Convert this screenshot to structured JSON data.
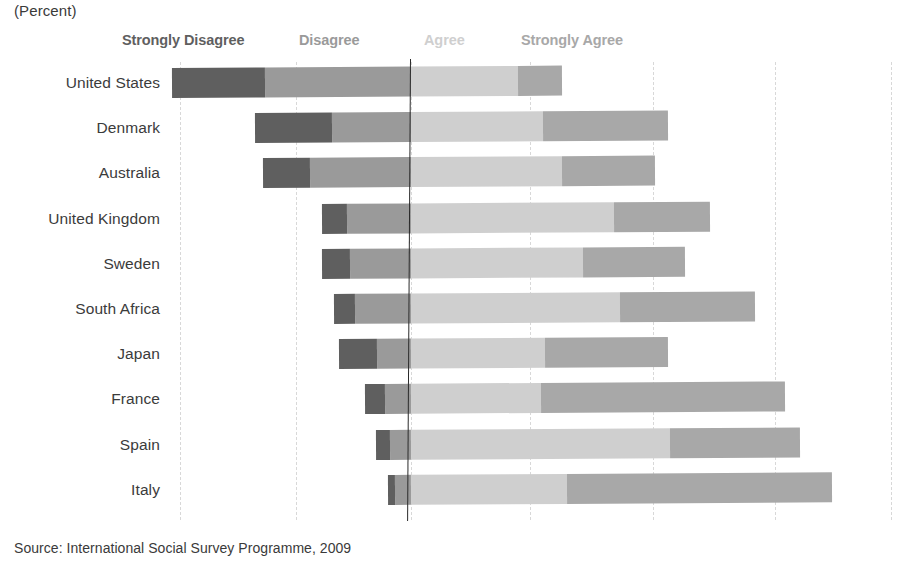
{
  "unit_label": "(Percent)",
  "source": "Source: International Social Survey Programme, 2009",
  "legend": {
    "strongly_disagree": "Strongly Disagree",
    "disagree": "Disagree",
    "agree": "Agree",
    "strongly_agree": "Strongly Agree"
  },
  "colors": {
    "strongly_disagree": "#5f5f5f",
    "disagree": "#9a9a9a",
    "agree": "#cfcfcf",
    "strongly_agree": "#a8a8a8",
    "zero_line": "#2b2b2b",
    "gridline": "#d8d8d8",
    "text": "#3b3b3b",
    "background": "#ffffff"
  },
  "chart_data": {
    "type": "bar",
    "subtype": "diverging-stacked-horizontal",
    "title": "",
    "subtitle": "(Percent)",
    "xlabel": "",
    "ylabel": "",
    "grid": true,
    "legend_position": "top",
    "axis": {
      "zero_at": "boundary between Disagree and Agree",
      "gridline_spacing_points": 25,
      "gridline_positions_px": [
        180,
        296,
        411,
        530,
        653,
        775,
        891
      ],
      "zero_line_px": 411,
      "px_per_point": 4.72
    },
    "legend_entries": [
      "Strongly Disagree",
      "Disagree",
      "Agree",
      "Strongly Agree"
    ],
    "categories": [
      "United States",
      "Denmark",
      "Australia",
      "United Kingdom",
      "Sweden",
      "South Africa",
      "Japan",
      "France",
      "Spain",
      "Italy"
    ],
    "series": [
      {
        "name": "Strongly Disagree",
        "color": "#5f5f5f",
        "values": [
          19.7,
          16.3,
          10.0,
          5.3,
          5.9,
          4.4,
          8.1,
          4.2,
          3.0,
          1.5
        ]
      },
      {
        "name": "Disagree",
        "color": "#9a9a9a",
        "values": [
          30.9,
          16.7,
          21.4,
          13.6,
          12.9,
          11.9,
          7.2,
          5.5,
          4.4,
          3.4
        ]
      },
      {
        "name": "Agree",
        "color": "#cfcfcf",
        "values": [
          22.7,
          28.0,
          32.0,
          43.0,
          36.4,
          44.3,
          28.4,
          27.5,
          54.9,
          33.1
        ]
      },
      {
        "name": "Strongly Agree",
        "color": "#a8a8a8",
        "values": [
          9.3,
          26.5,
          19.7,
          20.3,
          21.6,
          28.6,
          26.1,
          51.7,
          27.5,
          56.1
        ]
      }
    ],
    "bar_geometry_px": [
      {
        "category": "United States",
        "start": 172,
        "sd_end": 265,
        "d_end": 411,
        "a_end": 518,
        "end": 562
      },
      {
        "category": "Denmark",
        "start": 255,
        "sd_end": 332,
        "d_end": 411,
        "a_end": 543,
        "end": 668
      },
      {
        "category": "Australia",
        "start": 263,
        "sd_end": 310,
        "d_end": 411,
        "a_end": 562,
        "end": 655
      },
      {
        "category": "United Kingdom",
        "start": 322,
        "sd_end": 347,
        "d_end": 411,
        "a_end": 614,
        "end": 710
      },
      {
        "category": "Sweden",
        "start": 322,
        "sd_end": 350,
        "d_end": 411,
        "a_end": 583,
        "end": 685
      },
      {
        "category": "South Africa",
        "start": 334,
        "sd_end": 355,
        "d_end": 411,
        "a_end": 620,
        "end": 755
      },
      {
        "category": "Japan",
        "start": 339,
        "sd_end": 377,
        "d_end": 411,
        "a_end": 545,
        "end": 668
      },
      {
        "category": "France",
        "start": 365,
        "sd_end": 385,
        "d_end": 411,
        "a_end": 541,
        "end": 785
      },
      {
        "category": "Spain",
        "start": 376,
        "sd_end": 390,
        "d_end": 411,
        "a_end": 670,
        "end": 800
      },
      {
        "category": "Italy",
        "start": 388,
        "sd_end": 395,
        "d_end": 411,
        "a_end": 567,
        "end": 832
      }
    ]
  }
}
